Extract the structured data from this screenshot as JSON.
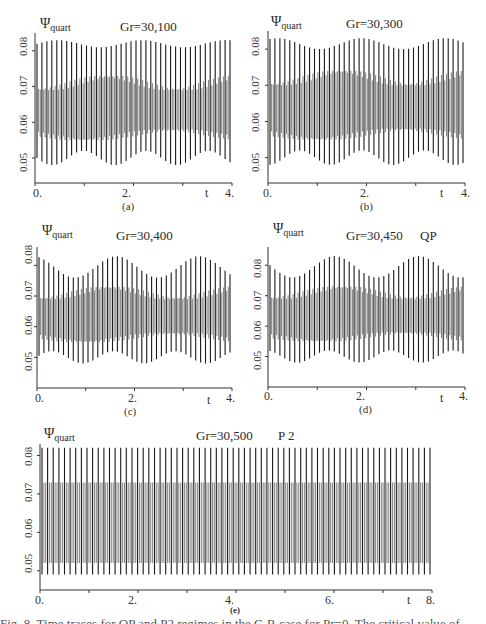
{
  "figure": {
    "y_symbol": "Ψ",
    "y_subscript": "quart",
    "x_axis_label": "t",
    "caption_partial": "Fig. 8. Time traces for QP and P2 regimes in the C-R case for Pr=0. The critical value of..."
  },
  "panels": [
    {
      "id": "a",
      "sublabel": "(a)",
      "title": "Gr=30,100",
      "regime": "",
      "xticks": [
        "0.",
        "2.",
        "4."
      ],
      "yticks": [
        "0.05",
        "0.06",
        "0.07",
        "0.08"
      ]
    },
    {
      "id": "b",
      "sublabel": "(b)",
      "title": "Gr=30,300",
      "regime": "",
      "xticks": [
        "0.",
        "2.",
        "4."
      ],
      "yticks": [
        "0.05",
        "0.06",
        "0.07",
        "0.08"
      ]
    },
    {
      "id": "c",
      "sublabel": "(c)",
      "title": "Gr=30,400",
      "regime": "",
      "xticks": [
        "0.",
        "2.",
        "4."
      ],
      "yticks": [
        "0.05",
        "0.06",
        "0.07",
        "0.08"
      ]
    },
    {
      "id": "d",
      "sublabel": "(d)",
      "title": "Gr=30,450",
      "regime": "QP",
      "xticks": [
        "0.",
        "2.",
        "4."
      ],
      "yticks": [
        "0.05",
        "0.06",
        "0.07",
        "0.08"
      ]
    },
    {
      "id": "e",
      "sublabel": "(e)",
      "title": "Gr=30,500",
      "regime": "P 2",
      "xticks": [
        "0.",
        "2.",
        "4.",
        "6.",
        "8."
      ],
      "yticks": [
        "0.05",
        "0.06",
        "0.07",
        "0.08"
      ]
    }
  ],
  "chart_data": [
    {
      "type": "line",
      "panel": "(a)",
      "title": "Gr=30,100",
      "xlabel": "t",
      "ylabel": "Ψ_quart",
      "xlim": [
        0,
        4
      ],
      "ylim": [
        0.043,
        0.085
      ],
      "xticks": [
        0,
        2,
        4
      ],
      "yticks": [
        0.05,
        0.06,
        0.07,
        0.08
      ],
      "series": [
        {
          "name": "Ψ_quart(t)",
          "description": "quasi-periodic oscillation, ~40 peaks",
          "upper_envelope": [
            0.081,
            0.083
          ],
          "lower_envelope": [
            0.048,
            0.052
          ],
          "inner_band": [
            0.055,
            0.073
          ],
          "oscillations_count": 40
        }
      ],
      "grid": false
    },
    {
      "type": "line",
      "panel": "(b)",
      "title": "Gr=30,300",
      "xlabel": "t",
      "ylabel": "Ψ_quart",
      "xlim": [
        0,
        4
      ],
      "ylim": [
        0.043,
        0.085
      ],
      "xticks": [
        0,
        2,
        4
      ],
      "yticks": [
        0.05,
        0.06,
        0.07,
        0.08
      ],
      "series": [
        {
          "name": "Ψ_quart(t)",
          "description": "quasi-periodic oscillation, ~40 peaks",
          "upper_envelope": [
            0.08,
            0.083
          ],
          "lower_envelope": [
            0.048,
            0.052
          ],
          "inner_band": [
            0.055,
            0.074
          ],
          "oscillations_count": 40
        }
      ],
      "grid": false
    },
    {
      "type": "line",
      "panel": "(c)",
      "title": "Gr=30,400",
      "xlabel": "t",
      "ylabel": "Ψ_quart",
      "xlim": [
        0,
        4
      ],
      "ylim": [
        0.04,
        0.086
      ],
      "xticks": [
        0,
        2,
        4
      ],
      "yticks": [
        0.05,
        0.06,
        0.07,
        0.08
      ],
      "series": [
        {
          "name": "Ψ_quart(t)",
          "description": "modulated oscillation, ~40 peaks",
          "upper_envelope": [
            0.076,
            0.083
          ],
          "lower_envelope": [
            0.048,
            0.052
          ],
          "inner_band": [
            0.055,
            0.073
          ],
          "oscillations_count": 40
        }
      ],
      "grid": false
    },
    {
      "type": "line",
      "panel": "(d)",
      "title": "Gr=30,450 QP",
      "xlabel": "t",
      "ylabel": "Ψ_quart",
      "xlim": [
        0,
        4
      ],
      "ylim": [
        0.04,
        0.086
      ],
      "xticks": [
        0,
        2,
        4
      ],
      "yticks": [
        0.05,
        0.06,
        0.07,
        0.08
      ],
      "series": [
        {
          "name": "Ψ_quart(t)",
          "description": "quasi-periodic (QP) oscillation, ~40 peaks",
          "upper_envelope": [
            0.076,
            0.083
          ],
          "lower_envelope": [
            0.048,
            0.052
          ],
          "inner_band": [
            0.055,
            0.073
          ],
          "oscillations_count": 40
        }
      ],
      "grid": false
    },
    {
      "type": "line",
      "panel": "(e)",
      "title": "Gr=30,500 P2",
      "xlabel": "t",
      "ylabel": "Ψ_quart",
      "xlim": [
        0,
        8
      ],
      "ylim": [
        0.045,
        0.083
      ],
      "xticks": [
        0,
        2,
        4,
        6,
        8
      ],
      "yticks": [
        0.05,
        0.06,
        0.07,
        0.08
      ],
      "series": [
        {
          "name": "Ψ_quart(t)",
          "description": "period-2 (P2) periodic oscillation, ~70 peaks",
          "upper_envelope": [
            0.082,
            0.082
          ],
          "lower_envelope": [
            0.049,
            0.049
          ],
          "inner_band": [
            0.052,
            0.073
          ],
          "oscillations_count": 70
        }
      ],
      "grid": false
    }
  ]
}
